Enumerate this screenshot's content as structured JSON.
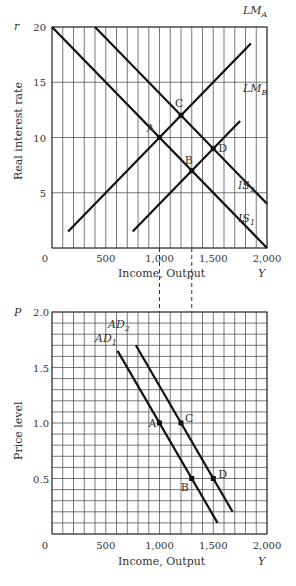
{
  "chart_data": [
    {
      "type": "line",
      "title": "IS-LM diagram",
      "xlabel": "Income, Output",
      "xsymbol": "Y",
      "ylabel": "Real interest rate",
      "ysymbol": "r",
      "xlim": [
        0,
        2000
      ],
      "ylim": [
        0,
        20
      ],
      "xticks": [
        "0",
        "500",
        "1,000",
        "1,500",
        "2,000"
      ],
      "yticks": [
        "5",
        "10",
        "15",
        "20"
      ],
      "grid": true,
      "series": [
        {
          "name": "IS1",
          "label_main": "IS",
          "label_sub": "1",
          "x": [
            0,
            2000
          ],
          "y": [
            20,
            0
          ]
        },
        {
          "name": "IS2",
          "label_main": "IS",
          "label_sub": "2",
          "x": [
            400,
            2000
          ],
          "y": [
            20,
            4
          ]
        },
        {
          "name": "LMA",
          "label_main": "LM",
          "label_sub": "A",
          "x": [
            150,
            1850
          ],
          "y": [
            1.5,
            18.5
          ]
        },
        {
          "name": "LMB",
          "label_main": "LM",
          "label_sub": "B",
          "x": [
            750,
            1750
          ],
          "y": [
            1.5,
            11.5
          ]
        }
      ],
      "points": [
        {
          "label": "A",
          "x": 1000,
          "y": 10
        },
        {
          "label": "B",
          "x": 1300,
          "y": 7
        },
        {
          "label": "C",
          "x": 1200,
          "y": 12
        },
        {
          "label": "D",
          "x": 1500,
          "y": 9
        }
      ]
    },
    {
      "type": "line",
      "title": "Aggregate demand diagram",
      "xlabel": "Income, Output",
      "xsymbol": "Y",
      "ylabel": "Price level",
      "ysymbol": "P",
      "xlim": [
        0,
        2000
      ],
      "ylim": [
        0,
        2.0
      ],
      "xticks": [
        "0",
        "500",
        "1,000",
        "1,500",
        "2,000"
      ],
      "yticks": [
        "0.5",
        "1.0",
        "1.5",
        "2.0"
      ],
      "grid": true,
      "series": [
        {
          "name": "AD1",
          "label_main": "AD",
          "label_sub": "1",
          "x": [
            610,
            1540
          ],
          "y": [
            1.65,
            0.1
          ]
        },
        {
          "name": "AD2",
          "label_main": "AD",
          "label_sub": "2",
          "x": [
            780,
            1680
          ],
          "y": [
            1.7,
            0.2
          ]
        }
      ],
      "points": [
        {
          "label": "A",
          "x": 1000,
          "y": 1.0
        },
        {
          "label": "B",
          "x": 1300,
          "y": 0.5
        },
        {
          "label": "C",
          "x": 1200,
          "y": 1.0
        },
        {
          "label": "D",
          "x": 1500,
          "y": 0.5
        }
      ],
      "dashed_links": [
        1000,
        1300
      ]
    }
  ],
  "labels": {
    "top_ysymbol": "r",
    "top_ylabel": "Real interest rate",
    "top_xlabel": "Income, Output",
    "top_xsymbol": "Y",
    "bottom_ysymbol": "P",
    "bottom_ylabel": "Price level",
    "bottom_xlabel": "Income, Output",
    "bottom_xsymbol": "Y",
    "origin": "0"
  }
}
